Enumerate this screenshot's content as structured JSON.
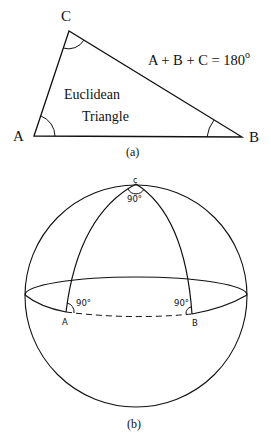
{
  "figure_a": {
    "caption": "(a)",
    "vertex_labels": {
      "A": "A",
      "B": "B",
      "C": "C"
    },
    "body_text_line1": "Euclidean",
    "body_text_line2": "Triangle",
    "equation": "A + B + C = 180",
    "equation_superscript": "o"
  },
  "figure_b": {
    "caption": "(b)",
    "vertex_labels": {
      "A": "A",
      "B": "B",
      "C": "c"
    },
    "angle_labels": {
      "A": "90°",
      "B": "90°",
      "C": "90°"
    }
  },
  "colors": {
    "ink": "#111111",
    "background": "#ffffff"
  }
}
